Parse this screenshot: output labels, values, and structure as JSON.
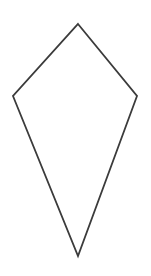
{
  "figure": {
    "kind": "geometric-shape-diagram",
    "shape_name": "kite",
    "background_color": "#ffffff",
    "canvas": {
      "width": 151,
      "height": 276
    },
    "shape": {
      "name": "kite-quadrilateral",
      "closed": true,
      "fill": "none",
      "stroke_color": "#3b3b3b",
      "stroke_width": 1.8,
      "points": "78,24 137,96 78,256 13,96",
      "vertices": [
        {
          "label": "top-apex",
          "x": 78,
          "y": 24
        },
        {
          "label": "right-vertex",
          "x": 137,
          "y": 96
        },
        {
          "label": "bottom-tip",
          "x": 78,
          "y": 256
        },
        {
          "label": "left-vertex",
          "x": 13,
          "y": 96
        }
      ]
    }
  },
  "chart_data": {
    "type": "scatter",
    "title": "",
    "xlabel": "",
    "ylabel": "",
    "grid": false,
    "legend": null,
    "xlim": [
      0,
      151
    ],
    "ylim": [
      0,
      276
    ],
    "series": [
      {
        "name": "kite-outline",
        "closed": true,
        "x": [
          78,
          137,
          78,
          13
        ],
        "y": [
          24,
          96,
          256,
          96
        ]
      }
    ]
  }
}
